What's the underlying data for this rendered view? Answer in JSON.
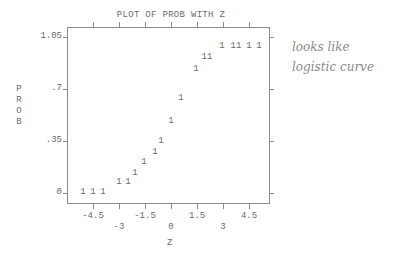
{
  "chart_data": {
    "type": "scatter",
    "title": "PLOT OF PROB WITH Z",
    "xlabel": "Z",
    "ylabel": "PROB",
    "plot_symbol": "1",
    "xlim": [
      -5.4,
      5.4
    ],
    "ylim": [
      -0.06,
      1.09
    ],
    "x_ticks": [
      -4.5,
      -3,
      -1.5,
      0,
      1.5,
      3,
      4.5
    ],
    "x_tick_labels": [
      "-4.5",
      "-3",
      "-1.5",
      "0",
      "1.5",
      "3",
      "4.5"
    ],
    "y_ticks": [
      0,
      0.35,
      0.7,
      1.05
    ],
    "y_tick_labels": [
      "0",
      ".35",
      ".7",
      "1.05"
    ],
    "grid": false,
    "legend": null,
    "points": [
      {
        "x": -5.1,
        "y": 0.0,
        "label": "1"
      },
      {
        "x": -4.5,
        "y": 0.0,
        "label": "1"
      },
      {
        "x": -3.9,
        "y": 0.0,
        "label": "1"
      },
      {
        "x": -3.0,
        "y": 0.07,
        "label": "1"
      },
      {
        "x": -2.5,
        "y": 0.07,
        "label": "1"
      },
      {
        "x": -2.1,
        "y": 0.13,
        "label": "1"
      },
      {
        "x": -1.55,
        "y": 0.2,
        "label": "1"
      },
      {
        "x": -0.9,
        "y": 0.27,
        "label": "1"
      },
      {
        "x": -0.6,
        "y": 0.34,
        "label": "1"
      },
      {
        "x": 0.0,
        "y": 0.48,
        "label": "1"
      },
      {
        "x": 0.6,
        "y": 0.63,
        "label": "1"
      },
      {
        "x": 1.45,
        "y": 0.83,
        "label": "1"
      },
      {
        "x": 2.1,
        "y": 0.91,
        "label": "11"
      },
      {
        "x": 2.95,
        "y": 0.98,
        "label": "1"
      },
      {
        "x": 3.75,
        "y": 0.98,
        "label": "11"
      },
      {
        "x": 4.5,
        "y": 0.98,
        "label": "1"
      },
      {
        "x": 5.1,
        "y": 0.98,
        "label": "1"
      }
    ],
    "annotations": [
      "looks like logistic curve"
    ]
  },
  "handwritten_note": {
    "line1": "looks like",
    "line2": "logistic curve"
  }
}
